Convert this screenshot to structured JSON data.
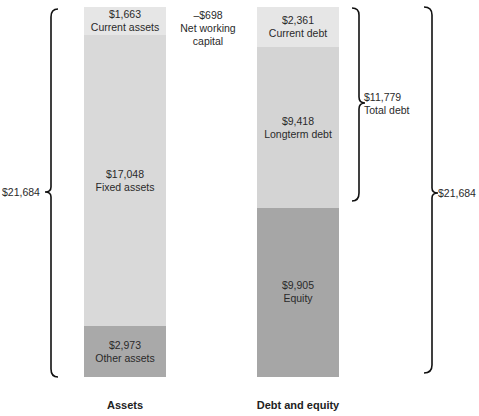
{
  "chart_data": {
    "type": "stacked-bar",
    "title": "",
    "categories": [
      "Assets",
      "Debt and equity"
    ],
    "bars": [
      {
        "name": "Assets",
        "segments": [
          {
            "label": "Current assets",
            "value": 1663,
            "display": "$1,663",
            "color": "#e6e6e6"
          },
          {
            "label": "Fixed assets",
            "value": 17048,
            "display": "$17,048",
            "color": "#d9d9d9"
          },
          {
            "label": "Other assets",
            "value": 2973,
            "display": "$2,973",
            "color": "#a9a9a9"
          }
        ],
        "total_display": "$21,684"
      },
      {
        "name": "Debt and equity",
        "segments": [
          {
            "label": "Current debt",
            "value": 2361,
            "display": "$2,361",
            "color": "#e6e6e6"
          },
          {
            "label": "Longterm debt",
            "value": 9418,
            "display": "$9,418",
            "color": "#d4d4d4"
          },
          {
            "label": "Equity",
            "value": 9905,
            "display": "$9,905",
            "color": "#a6a6a6"
          }
        ],
        "total_display": "$21,684"
      }
    ],
    "annotations": {
      "net_working_capital": {
        "value": "–$698",
        "line1": "Net working",
        "line2": "capital"
      },
      "total_debt": {
        "value": "$11,779",
        "label": "Total debt"
      },
      "assets_total": "$21,684",
      "debt_equity_total": "$21,684"
    },
    "total": 21684
  }
}
